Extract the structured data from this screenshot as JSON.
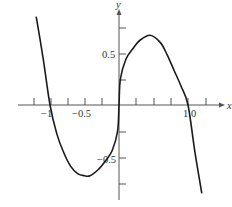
{
  "chart_data": {
    "type": "line",
    "title": "",
    "xlabel": "x",
    "ylabel": "y",
    "xlim": [
      -1.25,
      1.25
    ],
    "ylim": [
      -0.85,
      0.85
    ],
    "grid": false,
    "x_tick_labels": [
      "-1",
      "-0.5",
      "1.0"
    ],
    "y_tick_labels": [
      "0.5",
      "-0.5"
    ],
    "x_ticks": [
      -1.0,
      -0.75,
      -0.5,
      -0.25,
      0.25,
      0.5,
      0.75,
      1.0,
      1.25
    ],
    "y_ticks": [
      0.75,
      0.5,
      0.25,
      -0.25,
      -0.5,
      -0.75
    ],
    "series": [
      {
        "name": "curve",
        "x": [
          -1.2,
          -1.1,
          -1.0,
          -0.9,
          -0.8,
          -0.7,
          -0.6,
          -0.5,
          -0.42,
          -0.3,
          -0.2,
          -0.1,
          -0.02,
          0.0,
          0.02,
          0.1,
          0.2,
          0.3,
          0.45,
          0.6,
          0.7,
          0.8,
          0.9,
          1.0,
          1.1,
          1.2
        ],
        "y": [
          0.85,
          0.45,
          0.0,
          -0.28,
          -0.46,
          -0.59,
          -0.66,
          -0.68,
          -0.68,
          -0.62,
          -0.54,
          -0.44,
          -0.25,
          0.0,
          0.25,
          0.44,
          0.54,
          0.62,
          0.67,
          0.6,
          0.48,
          0.33,
          0.18,
          0.0,
          -0.45,
          -0.85
        ]
      }
    ],
    "annotations": []
  },
  "labels": {
    "x_axis": "x",
    "y_axis": "y",
    "x_tick_neg1": "−1",
    "x_tick_neg05": "−0.5",
    "x_tick_1": "1.0",
    "y_tick_05": "0.5",
    "y_tick_neg05": "−0.5"
  }
}
